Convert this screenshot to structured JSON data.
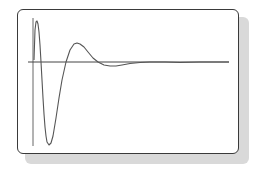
{
  "chart_data": {
    "type": "line",
    "title": "",
    "xlabel": "",
    "ylabel": "",
    "grid": false,
    "legend": null,
    "axes": {
      "y_axis": {
        "x": 33,
        "y_top": 18,
        "y_bottom": 146
      },
      "reference_line": {
        "y": 62,
        "x_start": 28,
        "x_end": 229
      }
    },
    "series": [
      {
        "name": "response",
        "color": "#555555",
        "points_px": [
          [
            34,
            60
          ],
          [
            35,
            30
          ],
          [
            36,
            22
          ],
          [
            37,
            21
          ],
          [
            38,
            24
          ],
          [
            39,
            32
          ],
          [
            40,
            45
          ],
          [
            41,
            62
          ],
          [
            42,
            80
          ],
          [
            43,
            98
          ],
          [
            44,
            114
          ],
          [
            45,
            127
          ],
          [
            46,
            136
          ],
          [
            47,
            142
          ],
          [
            49,
            145
          ],
          [
            51,
            143
          ],
          [
            53,
            136
          ],
          [
            56,
            118
          ],
          [
            59,
            98
          ],
          [
            62,
            80
          ],
          [
            66,
            62
          ],
          [
            70,
            50
          ],
          [
            74,
            44
          ],
          [
            77,
            43
          ],
          [
            80,
            44
          ],
          [
            84,
            47
          ],
          [
            88,
            52
          ],
          [
            93,
            58
          ],
          [
            98,
            62
          ],
          [
            104,
            65
          ],
          [
            110,
            66
          ],
          [
            116,
            66
          ],
          [
            122,
            65
          ],
          [
            130,
            63.5
          ],
          [
            140,
            62.5
          ],
          [
            150,
            62
          ],
          [
            165,
            62
          ],
          [
            180,
            62.5
          ],
          [
            200,
            62
          ],
          [
            229,
            62
          ]
        ]
      }
    ]
  },
  "colors": {
    "frame_border": "#3a3a3a",
    "shadow": "#d9d9d9",
    "axis": "#666666",
    "curve": "#555555",
    "reference": "#444444"
  }
}
